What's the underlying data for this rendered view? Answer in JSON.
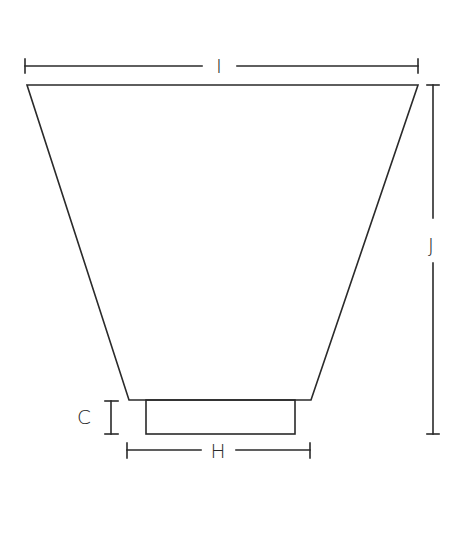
{
  "drawing": {
    "title": "Lamp shade dimension drawing",
    "labels": {
      "top_width": "I",
      "height": "J",
      "fitter_height": "C",
      "fitter_width": "H"
    },
    "colors": {
      "line": "#2a2a2a",
      "background": "#ffffff"
    }
  }
}
